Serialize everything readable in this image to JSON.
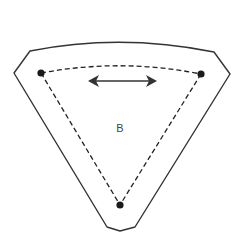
{
  "diagram": {
    "type": "region-schematic",
    "label": "B",
    "colors": {
      "outline": "#333333",
      "dashed": "#222222",
      "point": "#1a1a1a",
      "arrow": "#333333",
      "label": "#444444",
      "background": "#ffffff"
    },
    "points": [
      {
        "id": "left",
        "x": 41,
        "y": 73
      },
      {
        "id": "right",
        "x": 201,
        "y": 74
      },
      {
        "id": "bottom",
        "x": 120,
        "y": 205
      }
    ],
    "arrow": {
      "direction": "bidirectional-horizontal",
      "x1": 88,
      "x2": 157,
      "y": 81
    }
  }
}
